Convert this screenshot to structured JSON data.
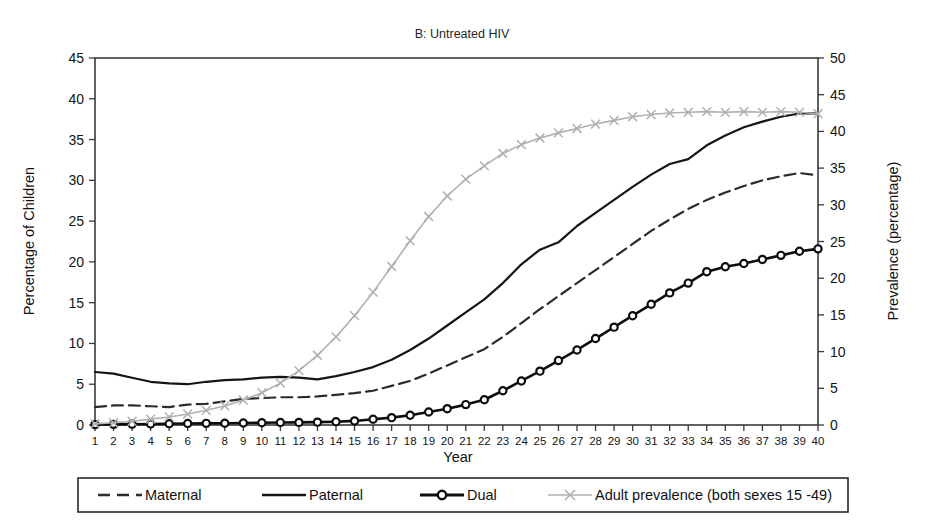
{
  "chart_data": {
    "type": "line",
    "title": "B: Untreated HIV",
    "xlabel": "Year",
    "ylabel": "Percentage of Children",
    "ylabel_right": "Prevalence (percentage)",
    "grid": false,
    "legend_position": "bottom",
    "xlim": [
      1,
      40
    ],
    "ylim": [
      0,
      45
    ],
    "ylim_right": [
      0,
      50
    ],
    "yticks": [
      0,
      5,
      10,
      15,
      20,
      25,
      30,
      35,
      40,
      45
    ],
    "yticks_right": [
      0,
      5,
      10,
      15,
      20,
      25,
      30,
      35,
      40,
      45,
      50
    ],
    "x": [
      1,
      2,
      3,
      4,
      5,
      6,
      7,
      8,
      9,
      10,
      11,
      12,
      13,
      14,
      15,
      16,
      17,
      18,
      19,
      20,
      21,
      22,
      23,
      24,
      25,
      26,
      27,
      28,
      29,
      30,
      31,
      32,
      33,
      34,
      35,
      36,
      37,
      38,
      39,
      40
    ],
    "xticklabels": [
      "1",
      "2",
      "3",
      "4",
      "5",
      "6",
      "7",
      "8",
      "9",
      "10",
      "11",
      "12",
      "13",
      "14",
      "15",
      "16",
      "17",
      "18",
      "19",
      "20",
      "21",
      "22",
      "23",
      "24",
      "25",
      "26",
      "27",
      "28",
      "29",
      "30",
      "31",
      "32",
      "33",
      "34",
      "35",
      "36",
      "37",
      "38",
      "39",
      "40"
    ],
    "series": [
      {
        "name": "Maternal",
        "axis": "left",
        "style": "dashed",
        "marker": "none",
        "color": "#2b2b2b",
        "values": [
          2.2,
          2.4,
          2.4,
          2.3,
          2.2,
          2.5,
          2.6,
          2.9,
          3.2,
          3.3,
          3.4,
          3.4,
          3.5,
          3.7,
          3.9,
          4.2,
          4.8,
          5.4,
          6.3,
          7.3,
          8.3,
          9.3,
          10.8,
          12.5,
          14.2,
          15.8,
          17.4,
          19.0,
          20.6,
          22.2,
          23.8,
          25.2,
          26.5,
          27.6,
          28.5,
          29.3,
          30.0,
          30.5,
          30.9,
          30.6
        ]
      },
      {
        "name": "Paternal",
        "axis": "left",
        "style": "solid",
        "marker": "none",
        "color": "#151515",
        "values": [
          6.5,
          6.3,
          5.8,
          5.3,
          5.1,
          5.0,
          5.3,
          5.5,
          5.6,
          5.8,
          5.9,
          5.8,
          5.6,
          6.0,
          6.5,
          7.1,
          8.0,
          9.2,
          10.6,
          12.2,
          13.8,
          15.4,
          17.4,
          19.7,
          21.5,
          22.4,
          24.4,
          26.0,
          27.6,
          29.2,
          30.7,
          32.0,
          32.6,
          34.3,
          35.5,
          36.5,
          37.2,
          37.8,
          38.2,
          38.2
        ]
      },
      {
        "name": "Dual",
        "axis": "left",
        "style": "solid",
        "marker": "circle",
        "color": "#0d0d0d",
        "values": [
          0.05,
          0.08,
          0.1,
          0.12,
          0.15,
          0.18,
          0.2,
          0.22,
          0.25,
          0.28,
          0.3,
          0.32,
          0.35,
          0.4,
          0.5,
          0.7,
          0.9,
          1.2,
          1.6,
          2.0,
          2.5,
          3.1,
          4.2,
          5.4,
          6.6,
          7.9,
          9.2,
          10.6,
          12.0,
          13.4,
          14.8,
          16.2,
          17.4,
          18.8,
          19.4,
          19.8,
          20.3,
          20.8,
          21.3,
          21.6
        ]
      },
      {
        "name": "Adult prevalence (both sexes 15 -49)",
        "axis": "right",
        "style": "solid",
        "marker": "x",
        "color": "#b0b0b0",
        "values": [
          0.15,
          0.3,
          0.5,
          0.8,
          1.1,
          1.5,
          2.0,
          2.6,
          3.4,
          4.4,
          5.7,
          7.4,
          9.5,
          12.0,
          14.9,
          18.1,
          21.6,
          25.1,
          28.4,
          31.2,
          33.5,
          35.3,
          37.0,
          38.2,
          39.1,
          39.8,
          40.4,
          41.0,
          41.5,
          42.0,
          42.3,
          42.5,
          42.6,
          42.7,
          42.6,
          42.7,
          42.6,
          42.7,
          42.6,
          42.4
        ]
      }
    ]
  },
  "legend": {
    "entries": [
      {
        "label": "Maternal",
        "key": "maternal"
      },
      {
        "label": "Paternal",
        "key": "paternal"
      },
      {
        "label": "Dual",
        "key": "dual"
      },
      {
        "label": "Adult prevalence (both sexes 15 -49)",
        "key": "adult-prevalence"
      }
    ]
  }
}
